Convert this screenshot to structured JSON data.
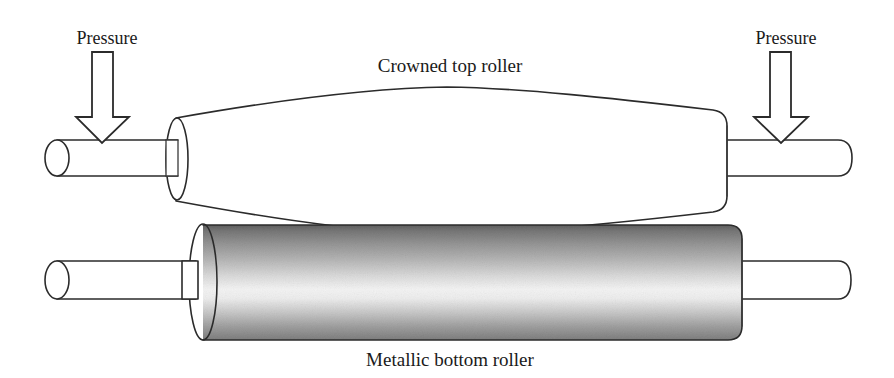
{
  "figure": {
    "title_top": "Crowned top roller",
    "title_bottom": "Metallic bottom roller",
    "pressure_left": "Pressure",
    "pressure_right": "Pressure",
    "arrow_left_name": "down-arrow-icon",
    "arrow_right_name": "down-arrow-icon",
    "colors": {
      "outline": "#2b2b2b",
      "text": "#1a1a1a",
      "background": "#ffffff",
      "metal_dark": "#6a6a6a",
      "metal_mid": "#9a9a9a",
      "metal_highlight": "#f2f2f2",
      "metal_shadow": "#7d7d7d",
      "top_roller_fill": "#ffffff"
    }
  }
}
